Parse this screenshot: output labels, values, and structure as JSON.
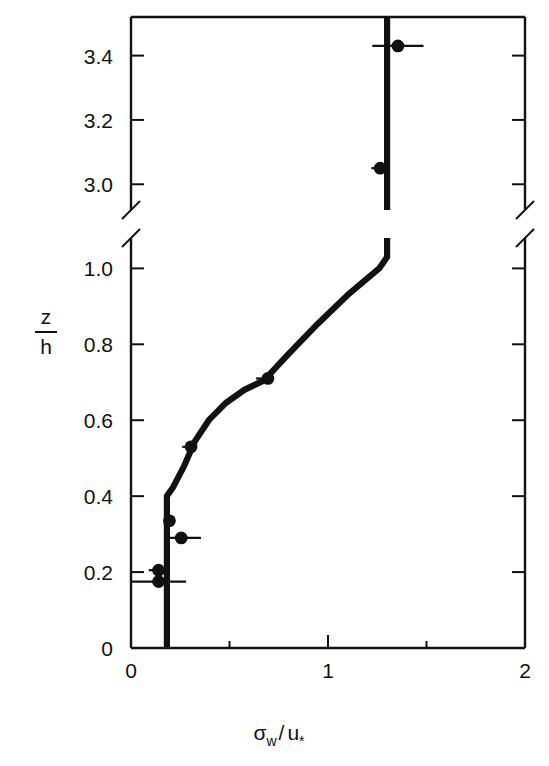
{
  "chart_data": {
    "type": "scatter",
    "title": "",
    "xlabel": "σw / u*",
    "xlabel_parts": {
      "sigma": "σ",
      "sub_w": "w",
      "slash": "/",
      "u": "u",
      "sub_star": "*"
    },
    "ylabel": "z / h",
    "ylabel_parts": {
      "numerator": "z",
      "denominator": "h"
    },
    "xlim": [
      0,
      2
    ],
    "xticks": [
      0,
      1,
      2
    ],
    "xticklabels": [
      "0",
      "1",
      "2"
    ],
    "xminorticks": [
      0.5,
      1.5
    ],
    "ylim_lower": [
      0,
      1.08
    ],
    "ylim_upper": [
      2.92,
      3.52
    ],
    "broken_axis": true,
    "break_between": [
      1.08,
      2.92
    ],
    "yticks_lower": [
      0,
      0.2,
      0.4,
      0.6,
      0.8,
      1.0
    ],
    "yticklabels_lower": [
      "0",
      "0.2",
      "0.4",
      "0.6",
      "0.8",
      "1.0"
    ],
    "yticks_upper": [
      3.0,
      3.2,
      3.4
    ],
    "yticklabels_upper": [
      "3.0",
      "3.2",
      "3.4"
    ],
    "grid": false,
    "legend": null,
    "marker": "filled-circle",
    "points": [
      {
        "x": 0.14,
        "y": 0.175,
        "xerr_low": 0.14,
        "xerr_high": 0.14
      },
      {
        "x": 0.14,
        "y": 0.205,
        "xerr_low": 0.05,
        "xerr_high": 0.05
      },
      {
        "x": 0.255,
        "y": 0.29,
        "xerr_low": 0.075,
        "xerr_high": 0.1
      },
      {
        "x": 0.195,
        "y": 0.335,
        "xerr_low": 0.0,
        "xerr_high": 0.0
      },
      {
        "x": 0.305,
        "y": 0.53,
        "xerr_low": 0.045,
        "xerr_high": 0.02
      },
      {
        "x": 0.695,
        "y": 0.71,
        "xerr_low": 0.06,
        "xerr_high": 0.025
      },
      {
        "x": 1.265,
        "y": 3.05,
        "xerr_low": 0.045,
        "xerr_high": 0.03
      },
      {
        "x": 1.355,
        "y": 3.43,
        "xerr_low": 0.13,
        "xerr_high": 0.13
      }
    ],
    "curve": {
      "name": "model profile",
      "style": "thick-solid",
      "points": [
        {
          "x": 0.182,
          "y": 0.0
        },
        {
          "x": 0.182,
          "y": 0.4
        },
        {
          "x": 0.215,
          "y": 0.425
        },
        {
          "x": 0.27,
          "y": 0.48
        },
        {
          "x": 0.325,
          "y": 0.545
        },
        {
          "x": 0.395,
          "y": 0.6
        },
        {
          "x": 0.48,
          "y": 0.645
        },
        {
          "x": 0.575,
          "y": 0.68
        },
        {
          "x": 0.675,
          "y": 0.705
        },
        {
          "x": 0.8,
          "y": 0.775
        },
        {
          "x": 0.95,
          "y": 0.855
        },
        {
          "x": 1.1,
          "y": 0.93
        },
        {
          "x": 1.26,
          "y": 1.0
        },
        {
          "x": 1.3,
          "y": 1.03
        },
        {
          "x": 1.3,
          "y": 3.52
        }
      ]
    }
  }
}
